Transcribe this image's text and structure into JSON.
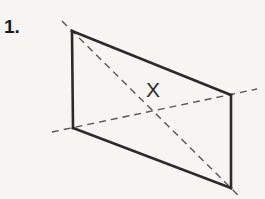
{
  "page": {
    "background_color": "#f6f5f2",
    "width": 265,
    "height": 199
  },
  "problem": {
    "number_label": "1."
  },
  "figure": {
    "name": "parallelogram-plane-with-diagonals",
    "stroke_color": "#2b2b2b",
    "dash_color": "#555555",
    "fill_color": "none",
    "solid_stroke_width": 2.6,
    "dash_stroke_width": 1.4,
    "dash_pattern": "7,5",
    "vertices": {
      "top_left": {
        "x": 72,
        "y": 31
      },
      "top_right": {
        "x": 231,
        "y": 95
      },
      "bottom_right": {
        "x": 231,
        "y": 188
      },
      "bottom_left": {
        "x": 73,
        "y": 128
      }
    },
    "edges": [
      {
        "name": "top-edge",
        "from": "top_left",
        "to": "top_right"
      },
      {
        "name": "right-edge",
        "from": "top_right",
        "to": "bottom_right"
      },
      {
        "name": "bottom-edge",
        "from": "bottom_right",
        "to": "bottom_left"
      },
      {
        "name": "left-edge",
        "from": "bottom_left",
        "to": "top_left"
      }
    ],
    "diagonals": [
      {
        "name": "diagonal-tl-br",
        "from": {
          "x": 62,
          "y": 21
        },
        "to": {
          "x": 240,
          "y": 197
        },
        "style": "dashed"
      },
      {
        "name": "diagonal-bl-tr",
        "from": {
          "x": 52,
          "y": 132
        },
        "to": {
          "x": 257,
          "y": 89
        },
        "style": "dashed"
      }
    ],
    "intersection_point": {
      "x": 150,
      "y": 110
    },
    "labels": [
      {
        "name": "label-x",
        "text": "X",
        "x": 155,
        "y": 90
      }
    ]
  }
}
